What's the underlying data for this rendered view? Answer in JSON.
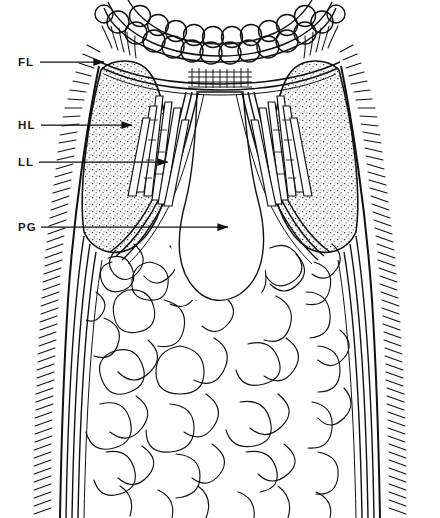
{
  "figure": {
    "type": "anatomical-line-drawing",
    "background_color": "#ffffff",
    "ink_color": "#111111",
    "width": 440,
    "height": 518
  },
  "labels": [
    {
      "id": "FL",
      "text": "FL",
      "x": 18,
      "y": 66,
      "leader_from_x": 40,
      "leader_from_y": 62,
      "leader_to_x": 104,
      "leader_to_y": 62,
      "arrow": true
    },
    {
      "id": "HL",
      "text": "HL",
      "x": 18,
      "y": 129,
      "leader_from_x": 41,
      "leader_from_y": 125,
      "leader_to_x": 132,
      "leader_to_y": 125,
      "arrow": true
    },
    {
      "id": "LL",
      "text": "LL",
      "x": 18,
      "y": 166,
      "leader_from_x": 39,
      "leader_from_y": 162,
      "leader_to_x": 168,
      "leader_to_y": 162,
      "arrow": true
    },
    {
      "id": "PG",
      "text": "PG",
      "x": 18,
      "y": 231,
      "leader_from_x": 41,
      "leader_from_y": 227,
      "leader_to_x": 228,
      "leader_to_y": 227,
      "arrow": true
    }
  ],
  "structures": {
    "crown": {
      "name": "hook-crown-arc",
      "rows": 2,
      "circles_per_row": 14,
      "description": "double arc row of overlapping circles at anterior tip"
    },
    "striated_band": {
      "name": "striated-band",
      "columns": 9,
      "rows": 4
    },
    "haptor_lobes": {
      "name": "stippled-lobes",
      "count": 2,
      "fill": "stipple"
    },
    "rod_bundles": {
      "name": "longitudinal-rod-cells",
      "count": 2,
      "rods_per_bundle": 6
    },
    "pharyngeal_bulb": {
      "name": "pharyngeal-bulb"
    },
    "gut_caeca": {
      "name": "convoluted-gut-tubules"
    },
    "ciliated_margin": {
      "name": "ciliated-body-margin"
    }
  }
}
